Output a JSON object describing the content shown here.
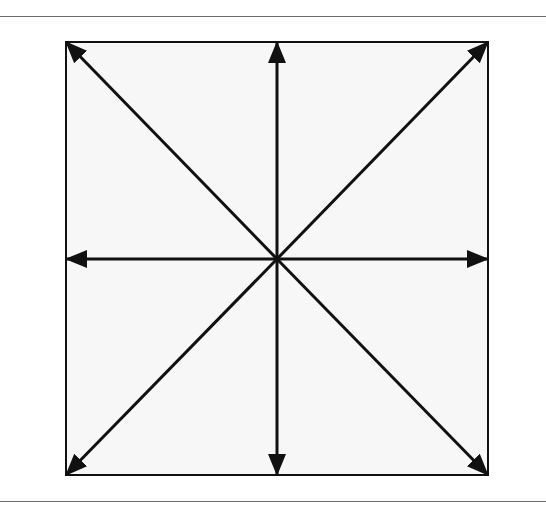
{
  "diagram": {
    "type": "radial-arrows",
    "frame": {
      "x": 66,
      "y": 42,
      "width": 422,
      "height": 433,
      "fill": "#f7f7f7",
      "stroke": "#111111"
    },
    "center": {
      "x": 277,
      "y": 259
    },
    "arrows": [
      {
        "direction": "up",
        "x": 277,
        "y": 42
      },
      {
        "direction": "down",
        "x": 277,
        "y": 475
      },
      {
        "direction": "left",
        "x": 66,
        "y": 259
      },
      {
        "direction": "right",
        "x": 488,
        "y": 259
      },
      {
        "direction": "up-left",
        "x": 66,
        "y": 42
      },
      {
        "direction": "up-right",
        "x": 488,
        "y": 42
      },
      {
        "direction": "down-left",
        "x": 66,
        "y": 475
      },
      {
        "direction": "down-right",
        "x": 488,
        "y": 475
      }
    ],
    "colors": {
      "line": "#111111",
      "rule": "#6a6a6a",
      "background": "#ffffff"
    }
  }
}
